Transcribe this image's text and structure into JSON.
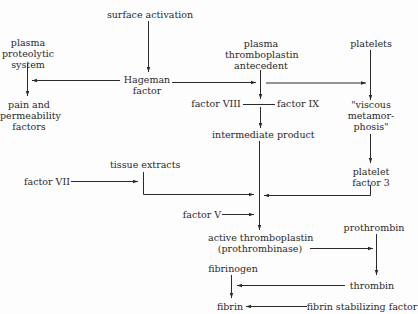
{
  "diagram": {
    "nodes": {
      "surface_activation": "surface activation",
      "plasma_proteolytic_system": "plasma\nproteolytic\nsystem",
      "hageman_factor": "Hageman\nfactor",
      "pain_permeability": "pain and\npermeability\nfactors",
      "pta": "plasma\nthromboplastin\nantecedent",
      "platelets": "platelets",
      "factor_viii": "factor VIII",
      "factor_ix": "factor IX",
      "viscous_metamorphosis": "\"viscous\nmetamor-\nphosis\"",
      "intermediate_product": "intermediate product",
      "tissue_extracts": "tissue extracts",
      "factor_vii": "factor VII",
      "platelet_factor_3": "platelet\nfactor 3",
      "factor_v": "factor V",
      "active_thromboplastin": "active thromboplastin\n(prothrombinase)",
      "prothrombin": "prothrombin",
      "fibrinogen": "fibrinogen",
      "thrombin": "thrombin",
      "fibrin": "fibrin",
      "fibrin_stabilizing_factor": "fibrin stabilizing factor"
    },
    "edges": [
      {
        "from": "surface activation",
        "to": "Hageman factor"
      },
      {
        "from": "Hageman factor",
        "to": "plasma proteolytic system"
      },
      {
        "from": "plasma proteolytic system",
        "to": "pain and permeability factors"
      },
      {
        "from": "Hageman factor",
        "to": "plasma thromboplastin antecedent"
      },
      {
        "from": "Hageman factor",
        "to": "viscous metamorphosis"
      },
      {
        "from": "platelets",
        "to": "viscous metamorphosis"
      },
      {
        "from": "plasma thromboplastin antecedent",
        "to": "factor VIII / factor IX"
      },
      {
        "from": "factor VIII / factor IX",
        "to": "intermediate product"
      },
      {
        "from": "viscous metamorphosis",
        "to": "platelet factor 3"
      },
      {
        "from": "factor VII",
        "to": "tissue extracts"
      },
      {
        "from": "tissue extracts",
        "to": "active thromboplastin"
      },
      {
        "from": "platelet factor 3",
        "to": "active thromboplastin"
      },
      {
        "from": "factor V",
        "to": "active thromboplastin"
      },
      {
        "from": "intermediate product",
        "to": "active thromboplastin"
      },
      {
        "from": "active thromboplastin",
        "to": "prothrombin"
      },
      {
        "from": "prothrombin",
        "to": "thrombin"
      },
      {
        "from": "thrombin",
        "to": "fibrinogen"
      },
      {
        "from": "fibrinogen",
        "to": "fibrin"
      },
      {
        "from": "fibrin stabilizing factor",
        "to": "fibrin"
      }
    ],
    "colors": {
      "line": "#2a2a2a",
      "text": "#2a2a2a",
      "background": "#fdfdfd"
    }
  }
}
